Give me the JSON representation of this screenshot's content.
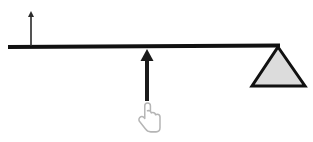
{
  "figure": {
    "title": "Lever with fulcrum, applied force arrow and hand cursor",
    "width": 313,
    "height": 142,
    "background_color": "#ffffff"
  },
  "colors": {
    "stroke": "#1a1a1a",
    "bar": "#111111",
    "fulcrum_fill": "#dcdcdc",
    "fulcrum_stroke": "#111111",
    "thin_arrow": "#2b2b2b",
    "cursor_outline": "#b5b5b5",
    "cursor_fill": "#ffffff"
  },
  "elements": {
    "lever_bar": {
      "name": "lever-bar",
      "x1": 8,
      "y1": 47,
      "x2": 280,
      "y2": 45.5,
      "thickness": 4
    },
    "fulcrum": {
      "name": "fulcrum-triangle",
      "apex_x": 278,
      "apex_y": 47,
      "base_left_x": 252,
      "base_right_x": 305,
      "base_y": 86,
      "stroke_width": 3,
      "fill": "#dcdcdc"
    },
    "force_arrow": {
      "name": "applied-force-arrow",
      "x": 147,
      "tail_y": 101,
      "head_y": 49,
      "shaft_width": 4,
      "head_width": 13,
      "head_height": 12
    },
    "motion_arrow": {
      "name": "load-motion-arrow",
      "x": 31,
      "tail_y": 46,
      "head_y": 11,
      "shaft_width": 1.6,
      "head_width": 6,
      "head_height": 6
    },
    "hand_cursor": {
      "name": "hand-pointer-cursor",
      "x": 139,
      "y": 103,
      "width": 21,
      "height": 31
    }
  }
}
